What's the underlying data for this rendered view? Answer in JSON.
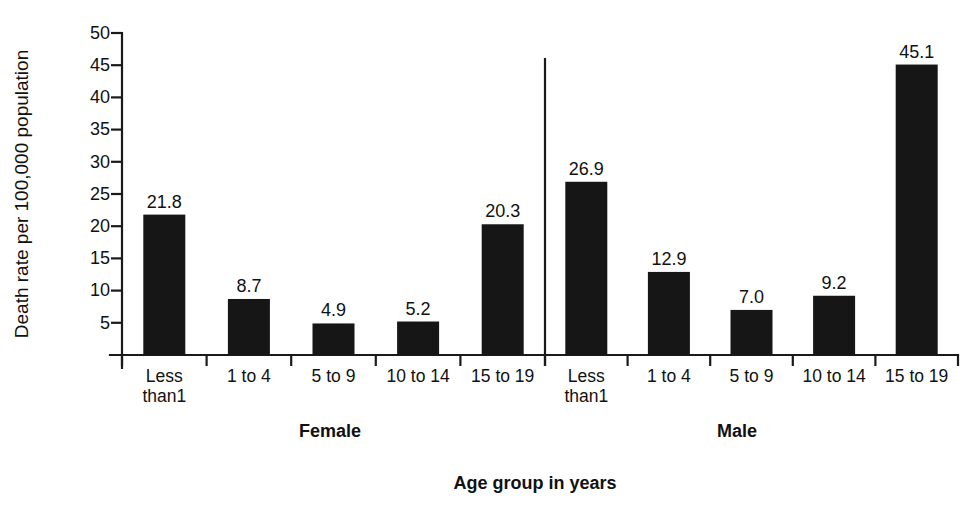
{
  "chart_data": {
    "type": "bar",
    "title": "",
    "subtitle": "",
    "xlabel": "Age group in years",
    "ylabel": "Death rate per 100,000 population",
    "ylim": [
      0,
      50
    ],
    "ytick_values": [
      5,
      10,
      15,
      20,
      25,
      30,
      35,
      40,
      45,
      50
    ],
    "ytick_labels": [
      "5",
      "10",
      "15",
      "20",
      "25",
      "30",
      "35",
      "40",
      "45",
      "50"
    ],
    "grid": false,
    "legend": "none",
    "categories": [
      "Less than1",
      "1 to 4",
      "5 to 9",
      "10 to 14",
      "15 to 19"
    ],
    "groups": [
      {
        "name": "Female",
        "values": [
          21.8,
          8.7,
          4.9,
          5.2,
          20.3
        ],
        "value_labels": [
          "21.8",
          "8.7",
          "4.9",
          "5.2",
          "20.3"
        ],
        "categories": [
          "Less than1",
          "1 to 4",
          "5 to 9",
          "10 to 14",
          "15 to 19"
        ],
        "category_lines": [
          [
            "Less",
            "than1"
          ],
          [
            "1 to 4"
          ],
          [
            "5 to 9"
          ],
          [
            "10 to 14"
          ],
          [
            "15 to 19"
          ]
        ]
      },
      {
        "name": "Male",
        "values": [
          26.9,
          12.9,
          7.0,
          9.2,
          45.1
        ],
        "value_labels": [
          "26.9",
          "12.9",
          "7.0",
          "9.2",
          "45.1"
        ],
        "categories": [
          "Less than1",
          "1 to 4",
          "5 to 9",
          "10 to 14",
          "15 to 19"
        ],
        "category_lines": [
          [
            "Less",
            "than1"
          ],
          [
            "1 to 4"
          ],
          [
            "5 to 9"
          ],
          [
            "10 to 14"
          ],
          [
            "15 to 19"
          ]
        ]
      }
    ],
    "bar_color": "#161616",
    "axis_color": "#1a1a1a",
    "background_color": "#ffffff",
    "group_separator": true
  },
  "axis": {
    "y_title": "Death rate per 100,000 population",
    "x_title": "Age group in years"
  },
  "groups": {
    "female_label": "Female",
    "male_label": "Male"
  }
}
